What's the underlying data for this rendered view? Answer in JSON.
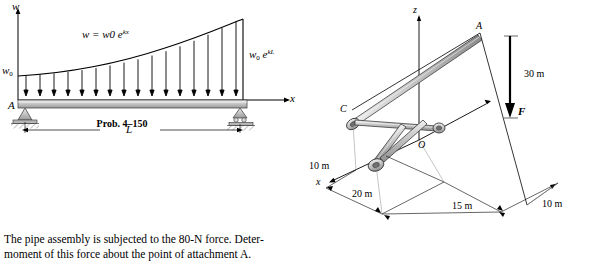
{
  "document": {
    "problem_caption": "Prob. 4–150",
    "body_text_line1": "The pipe assembly is subjected to the 80-N force. Deter-",
    "body_text_line2": "moment of this force about the point of attachment A."
  },
  "left_figure": {
    "name": "distributed-load-beam-diagram",
    "labels": {
      "w_axis_top": "w",
      "load_function": "w = w0 e",
      "load_function_exponent": "kx",
      "w_zero_left": "w0",
      "w_right": "w0",
      "w_right_exponent": "e",
      "w_right_exponent2": "kL",
      "point_A": "A",
      "x_axis": "x",
      "span_label": "L"
    },
    "colors": {
      "beam_fill": "#b8b8b8",
      "beam_edge": "#4a4a4a",
      "arrow": "#000000",
      "support_hatch": "#777777"
    }
  },
  "right_figure": {
    "name": "pipe-assembly-3d-diagram",
    "labels": {
      "z_axis": "z",
      "x_axis": "x",
      "point_A": "A",
      "point_C": "C",
      "point_O": "O",
      "force": "F",
      "dim_30m": "30 m",
      "dim_10m_left": "10 m",
      "dim_20m": "20 m",
      "dim_15m": "15 m",
      "dim_10m_right": "10 m"
    },
    "colors": {
      "pipe_fill": "#c9c9c9",
      "pipe_edge": "#3c3c3c",
      "line": "#000000",
      "dim_line": "#555555"
    }
  }
}
